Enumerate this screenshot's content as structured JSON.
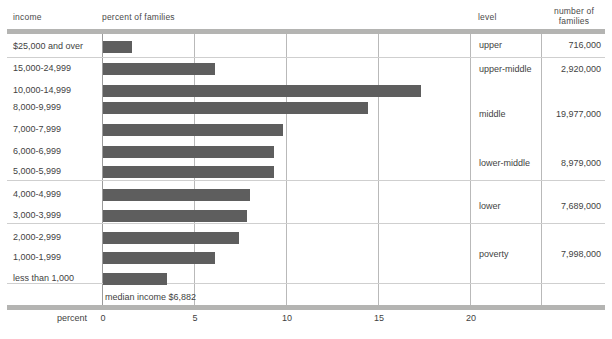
{
  "headers": {
    "income": "income",
    "percent": "percent of families",
    "level": "level",
    "number_line1": "number of",
    "number_line2": "families"
  },
  "axis": {
    "title": "percent",
    "ticks": [
      "0",
      "5",
      "10",
      "15",
      "20"
    ],
    "tick_values": [
      0,
      5,
      10,
      15,
      20
    ]
  },
  "annotation": {
    "median": "median income $6,882"
  },
  "colors": {
    "bar": "#5e5e5e",
    "band": "#b4b4b2",
    "rule": "#9b9b9b",
    "separator": "#cfcfcf",
    "text": "#3f3f3f"
  },
  "groups": [
    {
      "level": "upper",
      "families": "716,000"
    },
    {
      "level": "upper-middle",
      "families": "2,920,000"
    },
    {
      "level": "middle",
      "families": "19,977,000"
    },
    {
      "level": "lower-middle",
      "families": "8,979,000"
    },
    {
      "level": "lower",
      "families": "7,689,000"
    },
    {
      "level": "poverty",
      "families": "7,998,000"
    }
  ],
  "chart_data": {
    "type": "bar",
    "title": "percent of families",
    "xlabel": "percent",
    "ylabel": "income",
    "xlim": [
      0,
      22
    ],
    "grid": true,
    "orientation": "horizontal",
    "categories": [
      "$25,000 and over",
      "15,000-24,999",
      "10,000-14,999",
      "8,000-9,999",
      "7,000-7,999",
      "6,000-6,999",
      "5,000-5,999",
      "4,000-4,999",
      "3,000-3,999",
      "2,000-2,999",
      "1,000-1,999",
      "less than 1,000"
    ],
    "values": [
      1.6,
      6.1,
      17.3,
      14.4,
      9.8,
      9.3,
      9.3,
      8.0,
      7.8,
      7.4,
      6.1,
      3.5
    ],
    "annotations": [
      "median income $6,882"
    ],
    "legend": null
  }
}
